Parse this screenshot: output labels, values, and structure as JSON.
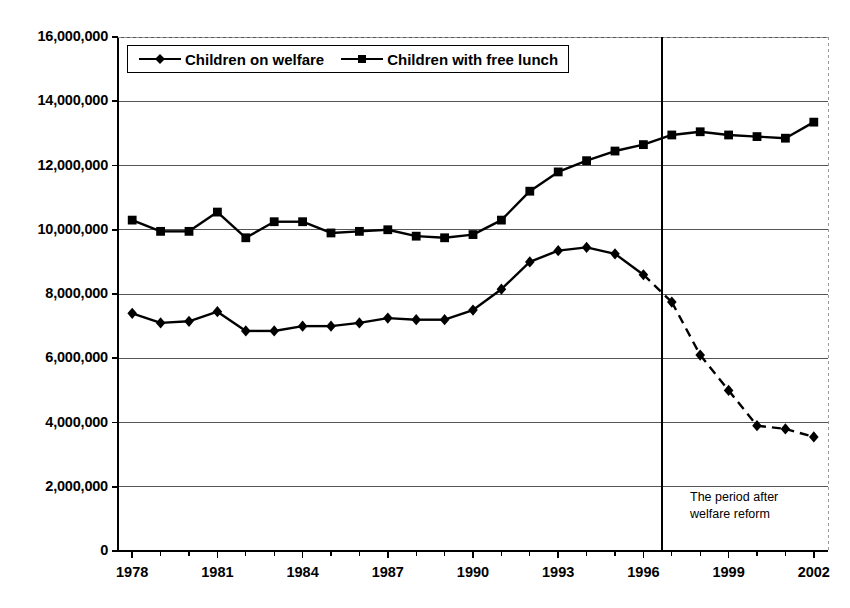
{
  "chart_data": {
    "type": "line",
    "title": "",
    "xlabel": "",
    "ylabel": "",
    "x": [
      1978,
      1979,
      1980,
      1981,
      1982,
      1983,
      1984,
      1985,
      1986,
      1987,
      1988,
      1989,
      1990,
      1991,
      1992,
      1993,
      1994,
      1995,
      1996,
      1997,
      1998,
      1999,
      2000,
      2001,
      2002
    ],
    "xlim": [
      1977.5,
      2002.5
    ],
    "ylim": [
      0,
      16000000
    ],
    "ytick_values": [
      0,
      2000000,
      4000000,
      6000000,
      8000000,
      10000000,
      12000000,
      14000000,
      16000000
    ],
    "ytick_labels": [
      "0",
      "2,000,000",
      "4,000,000",
      "6,000,000",
      "8,000,000",
      "10,000,000",
      "12,000,000",
      "14,000,000",
      "16,000,000"
    ],
    "xtick_labels": [
      "1978",
      "1981",
      "1984",
      "1987",
      "1990",
      "1993",
      "1996",
      "1999",
      "2002"
    ],
    "xtick_values": [
      1978,
      1981,
      1984,
      1987,
      1990,
      1993,
      1996,
      1999,
      2002
    ],
    "xtick_minor_values": [
      1979,
      1980,
      1982,
      1983,
      1985,
      1986,
      1988,
      1989,
      1991,
      1992,
      1994,
      1995,
      1997,
      1998,
      2000,
      2001
    ],
    "grid": "horizontal",
    "legend_position": "top-left-inside",
    "series": [
      {
        "name": "Children on welfare",
        "marker": "diamond",
        "color": "#000000",
        "values": [
          7400000,
          7100000,
          7150000,
          7450000,
          6850000,
          6850000,
          7000000,
          7000000,
          7100000,
          7250000,
          7200000,
          7200000,
          7500000,
          8150000,
          9000000,
          9350000,
          9450000,
          9250000,
          8600000,
          7750000,
          6100000,
          5000000,
          3900000,
          3800000,
          3550000
        ],
        "dashed_after_x": 1996
      },
      {
        "name": "Children with free lunch",
        "marker": "square",
        "color": "#000000",
        "values": [
          10300000,
          9950000,
          9950000,
          10550000,
          9750000,
          10250000,
          10250000,
          9900000,
          9950000,
          10000000,
          9800000,
          9750000,
          9850000,
          10300000,
          11200000,
          11800000,
          12150000,
          12450000,
          12650000,
          12950000,
          13050000,
          12950000,
          12900000,
          12850000,
          13350000
        ],
        "dashed_after_x": null
      }
    ],
    "annotations": [
      {
        "name": "welfare-reform-marker",
        "type": "vline",
        "x": 1996.65,
        "label": "The period after\nwelfare reform"
      }
    ]
  },
  "legend": {
    "items": [
      {
        "label": "Children on welfare",
        "marker": "diamond"
      },
      {
        "label": "Children with free lunch",
        "marker": "square"
      }
    ]
  },
  "annotation": {
    "text": "The period after\nwelfare reform"
  }
}
